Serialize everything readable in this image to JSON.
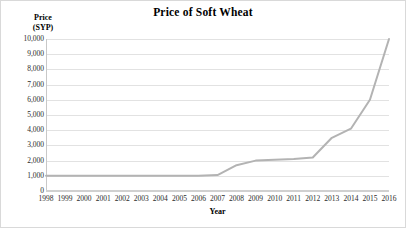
{
  "figure": {
    "title": "Price of Soft Wheat",
    "y_axis_title_line1": "Price",
    "y_axis_title_line2": "(SYP)",
    "x_axis_title": "Year",
    "line_color": "#b3b3b3",
    "gridline_color": "#e2e2e2",
    "text_color": "#2b2b2b",
    "background_color": "#ffffff"
  },
  "chart_data": {
    "type": "line",
    "title": "Price of Soft Wheat",
    "xlabel": "Year",
    "ylabel": "Price (SYP)",
    "xlim": [
      1998,
      2016
    ],
    "ylim": [
      0,
      10000
    ],
    "ytick_labels": [
      "10,000",
      "9,000",
      "8,000",
      "7,000",
      "6,000",
      "5,000",
      "4,000",
      "3,000",
      "2,000",
      "1,000",
      "0"
    ],
    "ytick_values": [
      10000,
      9000,
      8000,
      7000,
      6000,
      5000,
      4000,
      3000,
      2000,
      1000,
      0
    ],
    "grid": true,
    "legend": false,
    "categories": [
      "1998",
      "1999",
      "2000",
      "2001",
      "2002",
      "2003",
      "2004",
      "2005",
      "2006",
      "2007",
      "2008",
      "2009",
      "2010",
      "2011",
      "2012",
      "2013",
      "2014",
      "2015",
      "2016"
    ],
    "x": [
      1998,
      1999,
      2000,
      2001,
      2002,
      2003,
      2004,
      2005,
      2006,
      2007,
      2008,
      2009,
      2010,
      2011,
      2012,
      2013,
      2014,
      2015,
      2016
    ],
    "values": [
      1000,
      1000,
      1000,
      1000,
      1000,
      1000,
      1000,
      1000,
      1000,
      1050,
      1700,
      2000,
      2050,
      2100,
      2200,
      3500,
      4100,
      6000,
      10000
    ],
    "series": [
      {
        "name": "Price of Soft Wheat",
        "values": [
          1000,
          1000,
          1000,
          1000,
          1000,
          1000,
          1000,
          1000,
          1000,
          1050,
          1700,
          2000,
          2050,
          2100,
          2200,
          3500,
          4100,
          6000,
          10000
        ]
      }
    ]
  }
}
